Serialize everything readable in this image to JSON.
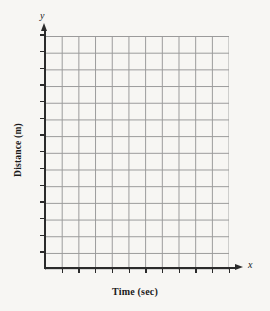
{
  "figure": {
    "kind": "blank-coordinate-grid",
    "background_color": "#f7f6f3"
  },
  "axis_titles": {
    "x": "Time (sec)",
    "y": "Distance (m)"
  },
  "axis_variables": {
    "x": "x",
    "y": "y"
  },
  "chart_data": {
    "type": "scatter",
    "title": "",
    "subtitle": "",
    "xlabel": "Time (sec)",
    "ylabel": "Distance (m)",
    "x_variable": "x",
    "y_variable": "y",
    "xlim": [
      0,
      11
    ],
    "ylim": [
      0,
      14
    ],
    "x_tick_count": 11,
    "y_tick_count": 14,
    "x_tick_labels": [],
    "y_tick_labels": [],
    "grid": true,
    "grid_spacing_px": 16.7,
    "grid_columns": 11,
    "grid_rows": 14,
    "grid_color": "#9a9a9a",
    "axis_color": "#2b2b2b",
    "legend": null,
    "legend_position": "none",
    "series": [],
    "annotations": [],
    "note": "Empty graph paper template — no plotted data points, no numeric tick labels"
  }
}
